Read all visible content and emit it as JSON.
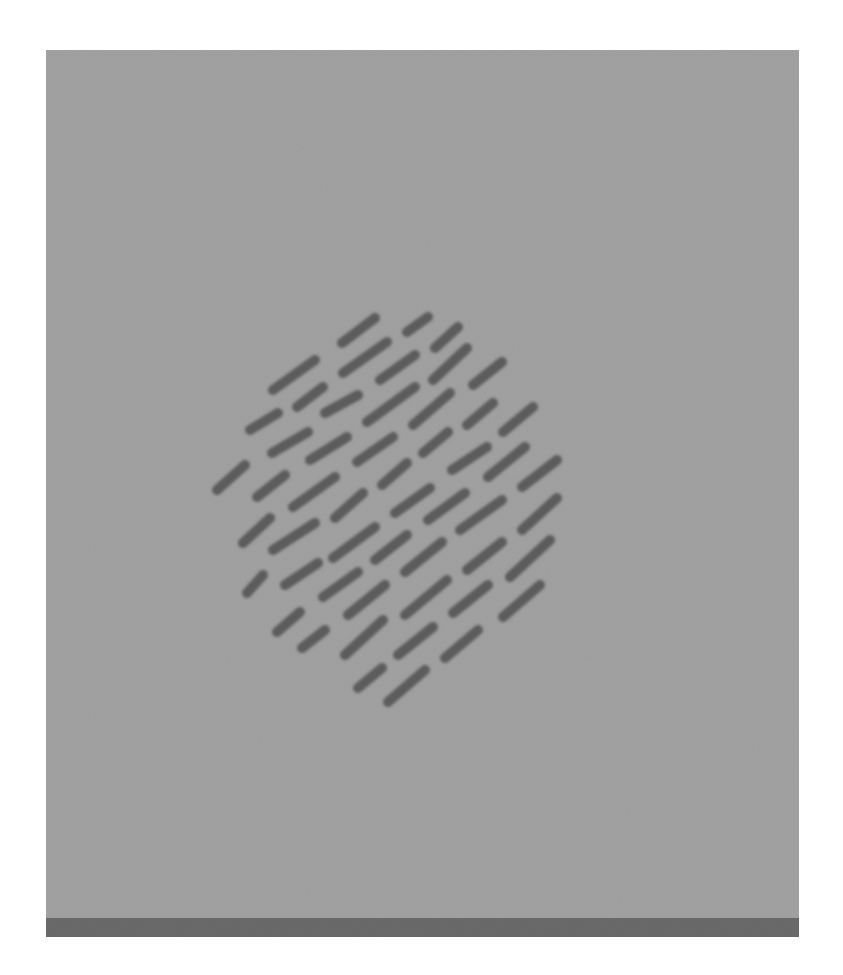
{
  "figure": {
    "panel": {
      "x": 46,
      "y": 50,
      "width": 753,
      "height": 868,
      "color": "#a3a3a3"
    },
    "bottom_bar": {
      "x": 46,
      "y": 918,
      "width": 753,
      "height": 19,
      "color": "#6b6b6b"
    },
    "segment_style": {
      "color": "#5b5b5b",
      "width": 10
    },
    "segments": [
      [
        342,
        343,
        375,
        318
      ],
      [
        407,
        332,
        428,
        317
      ],
      [
        435,
        348,
        458,
        327
      ],
      [
        343,
        373,
        387,
        342
      ],
      [
        380,
        380,
        415,
        355
      ],
      [
        433,
        380,
        467,
        348
      ],
      [
        473,
        385,
        502,
        362
      ],
      [
        273,
        390,
        315,
        360
      ],
      [
        297,
        407,
        323,
        387
      ],
      [
        325,
        413,
        358,
        395
      ],
      [
        367,
        422,
        415,
        387
      ],
      [
        413,
        425,
        450,
        393
      ],
      [
        467,
        425,
        493,
        403
      ],
      [
        503,
        432,
        533,
        407
      ],
      [
        250,
        430,
        278,
        413
      ],
      [
        272,
        453,
        308,
        432
      ],
      [
        310,
        460,
        347,
        437
      ],
      [
        357,
        462,
        393,
        437
      ],
      [
        423,
        453,
        448,
        432
      ],
      [
        452,
        470,
        487,
        447
      ],
      [
        488,
        477,
        525,
        447
      ],
      [
        522,
        487,
        557,
        460
      ],
      [
        217,
        490,
        245,
        465
      ],
      [
        257,
        497,
        285,
        475
      ],
      [
        293,
        507,
        335,
        477
      ],
      [
        335,
        518,
        363,
        493
      ],
      [
        382,
        485,
        407,
        463
      ],
      [
        395,
        513,
        430,
        488
      ],
      [
        428,
        520,
        465,
        493
      ],
      [
        460,
        530,
        502,
        500
      ],
      [
        522,
        530,
        557,
        498
      ],
      [
        243,
        543,
        270,
        518
      ],
      [
        273,
        550,
        315,
        523
      ],
      [
        333,
        558,
        375,
        527
      ],
      [
        375,
        560,
        407,
        535
      ],
      [
        405,
        572,
        442,
        542
      ],
      [
        467,
        570,
        502,
        542
      ],
      [
        510,
        577,
        550,
        540
      ],
      [
        247,
        593,
        263,
        575
      ],
      [
        285,
        585,
        318,
        563
      ],
      [
        323,
        597,
        358,
        572
      ],
      [
        348,
        615,
        385,
        585
      ],
      [
        405,
        615,
        447,
        580
      ],
      [
        453,
        613,
        488,
        585
      ],
      [
        503,
        617,
        540,
        585
      ],
      [
        277,
        632,
        300,
        612
      ],
      [
        302,
        648,
        325,
        630
      ],
      [
        345,
        655,
        383,
        620
      ],
      [
        398,
        655,
        433,
        627
      ],
      [
        445,
        658,
        478,
        630
      ],
      [
        358,
        688,
        382,
        668
      ],
      [
        388,
        702,
        425,
        670
      ]
    ]
  }
}
